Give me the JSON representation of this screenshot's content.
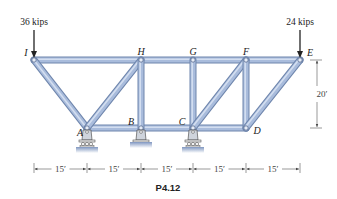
{
  "figure": {
    "caption": "P4.12",
    "colors": {
      "member_fill": "#a9bcdc",
      "member_edge": "#6f86ad",
      "member_highlight": "#d3def0",
      "support": "#cfd4dc",
      "ground": "#8ea3c8",
      "ink": "#222222",
      "dim_ink": "#555555"
    },
    "nodes": {
      "I": {
        "label": "I",
        "x": 34,
        "y": 60
      },
      "H": {
        "label": "H",
        "x": 141,
        "y": 60
      },
      "G": {
        "label": "G",
        "x": 193,
        "y": 60
      },
      "F": {
        "label": "F",
        "x": 246,
        "y": 60
      },
      "E": {
        "label": "E",
        "x": 300,
        "y": 60
      },
      "A": {
        "label": "A",
        "x": 87,
        "y": 128
      },
      "B": {
        "label": "B",
        "x": 141,
        "y": 128
      },
      "C": {
        "label": "C",
        "x": 193,
        "y": 128
      },
      "D": {
        "label": "D",
        "x": 246,
        "y": 128
      }
    },
    "members": [
      [
        "I",
        "E"
      ],
      [
        "A",
        "D"
      ],
      [
        "I",
        "A"
      ],
      [
        "A",
        "H"
      ],
      [
        "H",
        "B"
      ],
      [
        "G",
        "C"
      ],
      [
        "C",
        "F"
      ],
      [
        "F",
        "D"
      ],
      [
        "D",
        "E"
      ]
    ],
    "supports": [
      {
        "node": "A",
        "type": "roller"
      },
      {
        "node": "B",
        "type": "pin"
      },
      {
        "node": "C",
        "type": "roller"
      }
    ],
    "loads": [
      {
        "node": "I",
        "label": "36 kips",
        "direction": "down"
      },
      {
        "node": "E",
        "label": "24 kips",
        "direction": "down"
      }
    ],
    "dimensions": {
      "horizontal": [
        "15′",
        "15′",
        "15′",
        "15′",
        "15′"
      ],
      "vertical": "20′"
    }
  }
}
